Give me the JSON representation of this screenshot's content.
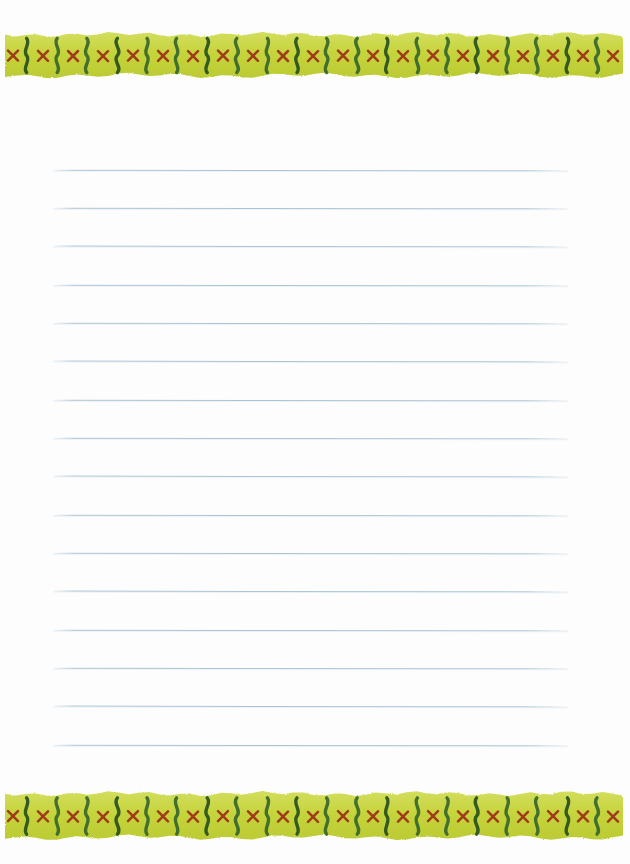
{
  "document": {
    "kind": "lined-stationery-sheet",
    "title": "Blank Ruled Stationery Page",
    "page_width": 630,
    "page_height": 864,
    "paper_color": "#fdfdfd",
    "outer_background": "#ffffff",
    "body_text": ""
  },
  "borders": {
    "motif_name": "x-and-squiggle-ribbon",
    "band_background_color": "#c6d43c",
    "band_background_color_light": "#d3de5e",
    "cross_color": "#9d3018",
    "squiggle_color": "#3b6a2b",
    "squiggle_color_dark": "#2d5520",
    "motif_period_px": 30,
    "top": {
      "label": "top-decorative-border",
      "y": 32,
      "height": 46
    },
    "bottom": {
      "label": "bottom-decorative-border",
      "y": 791,
      "height": 49
    }
  },
  "ruled_area": {
    "label": "writing-area",
    "line_color": "#a6c1d1",
    "line_left": 53,
    "line_right": 568,
    "line_width": 515,
    "first_line_y": 170,
    "line_spacing": 38.3,
    "line_count": 16,
    "line_positions": [
      170,
      208,
      246,
      285,
      323,
      361,
      400,
      438,
      476,
      515,
      553,
      591,
      630,
      668,
      706,
      745
    ]
  }
}
